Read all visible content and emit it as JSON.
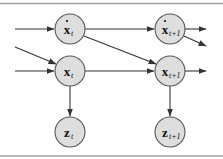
{
  "diagram": {
    "type": "dynamic-bayesian-network",
    "colors": {
      "node_fill": "#dedede",
      "node_stroke": "#555555",
      "edge": "#333333",
      "rule": "#a0a0a0"
    },
    "nodes": [
      {
        "id": "xdot_t",
        "base": "x",
        "dot": true,
        "sub": "t",
        "cx": 70,
        "cy": 29
      },
      {
        "id": "x_t",
        "base": "x",
        "dot": false,
        "sub": "t",
        "cx": 70,
        "cy": 71
      },
      {
        "id": "z_t",
        "base": "z",
        "dot": false,
        "sub": "t",
        "cx": 70,
        "cy": 132
      },
      {
        "id": "xdot_t1",
        "base": "x",
        "dot": true,
        "sub": "t+1",
        "cx": 170,
        "cy": 29
      },
      {
        "id": "x_t1",
        "base": "x",
        "dot": false,
        "sub": "t+1",
        "cx": 170,
        "cy": 71
      },
      {
        "id": "z_t1",
        "base": "z",
        "dot": false,
        "sub": "t+1",
        "cx": 170,
        "cy": 132
      }
    ],
    "edges": [
      {
        "from": "in",
        "to": "xdot_t"
      },
      {
        "from": "in",
        "to": "x_t"
      },
      {
        "from": "in-diag",
        "to": "x_t"
      },
      {
        "from": "xdot_t",
        "to": "xdot_t1"
      },
      {
        "from": "xdot_t",
        "to": "x_t1"
      },
      {
        "from": "x_t",
        "to": "x_t1"
      },
      {
        "from": "x_t",
        "to": "z_t"
      },
      {
        "from": "x_t1",
        "to": "z_t1"
      },
      {
        "from": "xdot_t1",
        "to": "out"
      },
      {
        "from": "xdot_t1",
        "to": "out-diag"
      },
      {
        "from": "x_t1",
        "to": "out"
      }
    ],
    "labels": {
      "xdot_t": {
        "base": "x",
        "sub": "t"
      },
      "x_t": {
        "base": "x",
        "sub": "t"
      },
      "z_t": {
        "base": "z",
        "sub": "t"
      },
      "xdot_t1": {
        "base": "x",
        "sub": "t+1"
      },
      "x_t1": {
        "base": "x",
        "sub": "t+1"
      },
      "z_t1": {
        "base": "z",
        "sub": "t+1"
      }
    }
  }
}
